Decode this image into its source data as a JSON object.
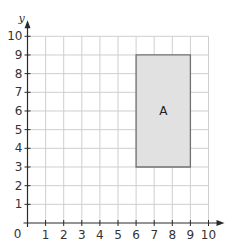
{
  "chart_data": {
    "type": "scatter",
    "title": "",
    "xlabel": "x",
    "ylabel": "y",
    "xlim": [
      0,
      10
    ],
    "ylim": [
      0,
      10
    ],
    "grid": true,
    "origin_label": "0",
    "x_ticks": [
      "1",
      "2",
      "3",
      "4",
      "5",
      "6",
      "7",
      "8",
      "9",
      "10"
    ],
    "y_ticks": [
      "1",
      "2",
      "3",
      "4",
      "5",
      "6",
      "7",
      "8",
      "9",
      "10"
    ],
    "shapes": [
      {
        "name": "A",
        "kind": "rectangle",
        "vertices": [
          [
            6,
            3
          ],
          [
            9,
            3
          ],
          [
            9,
            9
          ],
          [
            6,
            9
          ]
        ],
        "label_position": [
          7.5,
          6
        ],
        "fill": "#e1e1e1",
        "stroke": "#707070"
      }
    ]
  }
}
